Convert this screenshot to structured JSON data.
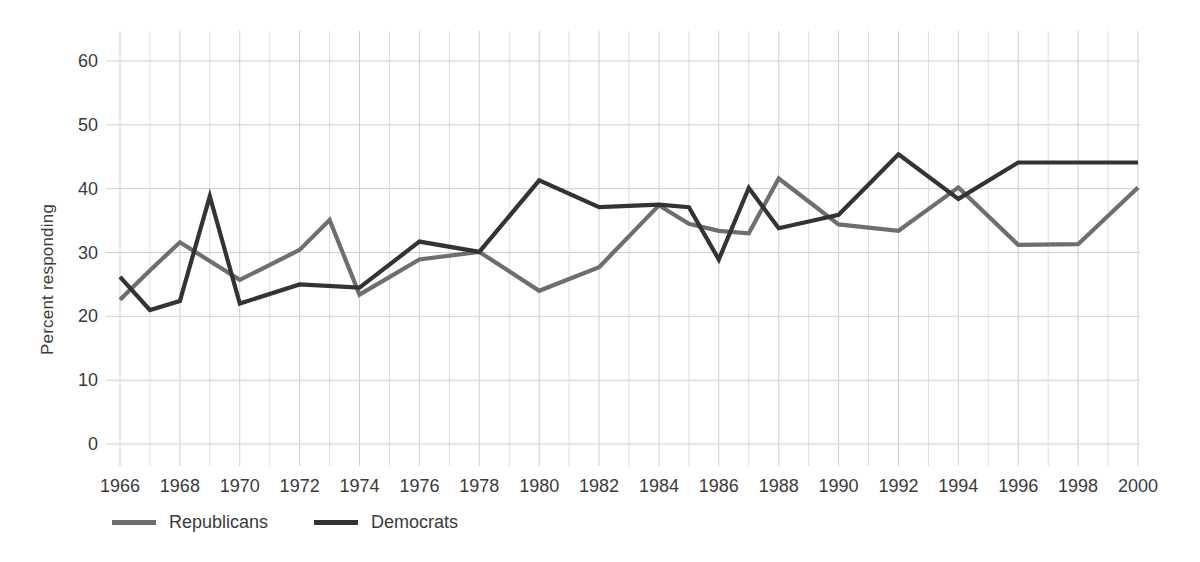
{
  "chart_data": {
    "type": "line",
    "title": "",
    "xlabel": "",
    "ylabel": "Percent responding",
    "xlim": [
      1966,
      2000
    ],
    "ylim": [
      0,
      65
    ],
    "yticks": [
      0,
      10,
      20,
      30,
      40,
      50,
      60
    ],
    "xticks": [
      1966,
      1968,
      1970,
      1972,
      1974,
      1976,
      1978,
      1980,
      1982,
      1984,
      1986,
      1988,
      1990,
      1992,
      1994,
      1996,
      1998,
      2000
    ],
    "grid": true,
    "legend_position": "bottom-left",
    "x": [
      1966,
      1967,
      1968,
      1969,
      1970,
      1971,
      1972,
      1973,
      1974,
      1975,
      1976,
      1977,
      1978,
      1979,
      1980,
      1981,
      1982,
      1983,
      1984,
      1985,
      1986,
      1987,
      1988,
      1989,
      1990,
      1991,
      1992,
      1993,
      1994,
      1995,
      1996,
      1997,
      1998,
      1999,
      2000
    ],
    "series": [
      {
        "name": "Republicans",
        "color": "#6e6e6e",
        "x": [
          1966,
          1967,
          1968,
          1970,
          1972,
          1973,
          1974,
          1976,
          1978,
          1980,
          1982,
          1984,
          1985,
          1986,
          1987,
          1988,
          1990,
          1992,
          1994,
          1996,
          1998,
          2000
        ],
        "values": [
          22.6,
          27.2,
          31.6,
          25.7,
          30.4,
          35.1,
          23.4,
          28.9,
          30.1,
          24.0,
          27.7,
          37.4,
          34.5,
          33.4,
          33.0,
          41.6,
          34.4,
          33.4,
          40.2,
          31.2,
          31.3,
          40.2
        ]
      },
      {
        "name": "Democrats",
        "color": "#333333",
        "x": [
          1966,
          1967,
          1968,
          1969,
          1970,
          1972,
          1974,
          1976,
          1978,
          1980,
          1982,
          1984,
          1985,
          1986,
          1987,
          1988,
          1990,
          1992,
          1994,
          1996,
          1998,
          2000
        ],
        "values": [
          26.2,
          21.0,
          22.4,
          38.8,
          22.0,
          25.0,
          24.5,
          31.7,
          30.1,
          41.3,
          37.1,
          37.5,
          37.1,
          28.9,
          40.1,
          33.8,
          35.9,
          45.4,
          38.4,
          44.1,
          44.1,
          44.1
        ]
      }
    ]
  },
  "legend": {
    "items": [
      {
        "label": "Republicans",
        "color": "#6e6e6e"
      },
      {
        "label": "Democrats",
        "color": "#333333"
      }
    ]
  },
  "colors": {
    "republicans": "#6e6e6e",
    "democrats": "#333333",
    "grid": "#cfcfcf",
    "text": "#3a3a3a",
    "background": "#ffffff"
  }
}
